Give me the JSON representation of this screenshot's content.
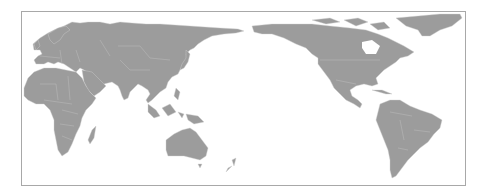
{
  "map": {
    "projection": "pacific-centered world map",
    "land_color": "#9c9c9c",
    "border_color": "#c4c4c4",
    "frame_color": "#a8a8a8",
    "background": "#ffffff",
    "regions": [
      "Europe",
      "Asia",
      "Africa",
      "Australia",
      "North America",
      "South America",
      "Greenland",
      "New Zealand",
      "Madagascar",
      "Japan",
      "Indonesia"
    ]
  }
}
